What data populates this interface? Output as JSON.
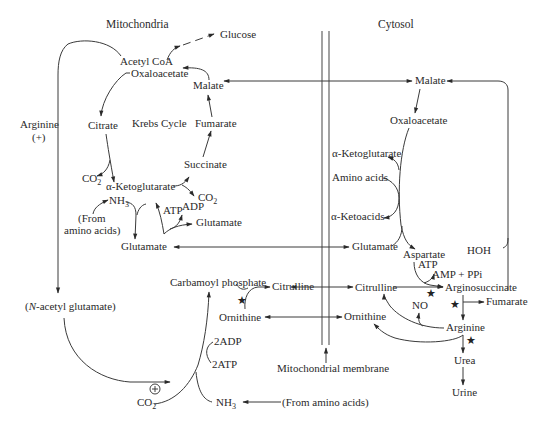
{
  "regions": {
    "mitochondria": "Mitochondria",
    "cytosol": "Cytosol",
    "membrane": "Mitochondrial membrane"
  },
  "mito": {
    "acetyl_coa": "Acetyl CoA",
    "oxaloacetate": "Oxaloacetate",
    "glucose": "Glucose",
    "malate": "Malate",
    "citrate": "Citrate",
    "krebs_cycle": "Krebs Cycle",
    "fumarate": "Fumarate",
    "succinate": "Succinate",
    "co2_left": "CO",
    "co2_right": "CO",
    "alpha_ketoglutarate": "α-Ketoglutarate",
    "nh3": "NH",
    "atp": "ATP",
    "adp": "ADP",
    "glutamate_small": "Glutamate",
    "from_amino_1": "(From",
    "from_amino_2": "amino acids)",
    "glutamate": "Glutamate",
    "carbamoyl_phosphate": "Carbamoyl phosphate",
    "citrulline": "Citrulline",
    "ornithine": "Ornithine",
    "two_adp": "2ADP",
    "two_atp": "2ATP",
    "co2_bottom": "CO",
    "nh3_bottom": "NH",
    "plus_sign": "+",
    "subscript_2": "2",
    "subscript_3": "3"
  },
  "left": {
    "arginine": "Arginine",
    "plus": "(+)",
    "nag_open": "(",
    "nag_n": "N",
    "nag_rest": "-acetyl glutamate)"
  },
  "cyto": {
    "malate": "Malate",
    "oxaloacetate": "Oxaloacetate",
    "alpha_ketoglutarate": "α-Ketoglutarate",
    "amino_acids": "Amino acids",
    "alpha_ketoacids": "α-Ketoacids",
    "glutamate": "Glutamate",
    "aspartate": "Aspartate",
    "atp": "ATP",
    "amp_ppi": "AMP + PPi",
    "hoh": "HOH",
    "citrulline": "Citrulline",
    "argininosuccinate": "Arginosuccinate",
    "no": "NO",
    "fumarate": "Fumarate",
    "ornithine": "Ornithine",
    "arginine": "Arginine",
    "urea": "Urea",
    "urine": "Urine",
    "from_amino_acids": "(From amino acids)"
  },
  "icons": {
    "enzyme_marker": "star-icon",
    "activation_marker": "circled-plus-icon"
  }
}
